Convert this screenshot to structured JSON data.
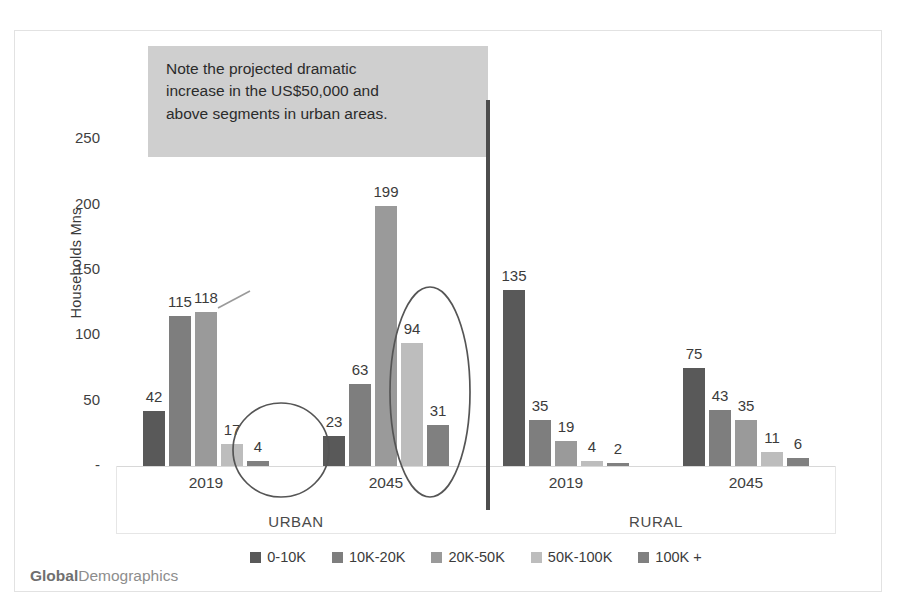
{
  "chart_data": {
    "type": "bar",
    "title": "",
    "xlabel": "",
    "ylabel": "Households Mns",
    "ylim": [
      0,
      280
    ],
    "yticks": [
      "-",
      "50",
      "100",
      "150",
      "200",
      "250"
    ],
    "ytick_values": [
      0,
      50,
      100,
      150,
      200,
      250
    ],
    "grid": false,
    "legend_position": "bottom",
    "categories": [
      "2019",
      "2045",
      "2019",
      "2045"
    ],
    "group_labels": [
      "URBAN",
      "RURAL"
    ],
    "series": [
      {
        "name": "0-10K",
        "color": "#595959",
        "values": [
          42,
          23,
          135,
          75
        ]
      },
      {
        "name": "10K-20K",
        "color": "#7e7e7e",
        "values": [
          115,
          63,
          35,
          43
        ]
      },
      {
        "name": "20K-50K",
        "color": "#9a9a9a",
        "values": [
          118,
          199,
          19,
          35
        ]
      },
      {
        "name": "50K-100K",
        "color": "#bdbdbd",
        "values": [
          17,
          94,
          4,
          11
        ]
      },
      {
        "name": "100K +",
        "color": "#808080",
        "values": [
          4,
          31,
          2,
          6
        ]
      }
    ],
    "annotations": [
      {
        "type": "callout",
        "text": "Note the projected dramatic increase in the US$50,000 and above segments in urban areas."
      },
      {
        "type": "ellipse",
        "target": "urban-2019-high-income"
      },
      {
        "type": "ellipse",
        "target": "urban-2045-high-income"
      },
      {
        "type": "divider",
        "target": "urban-rural-separator"
      }
    ]
  },
  "callout": {
    "line1": "Note the projected dramatic",
    "line2": "increase in the US$50,000 and",
    "line3": "above segments in urban areas.",
    "background": "#cfcfcf"
  },
  "axis": {
    "y_title": "Households Mns",
    "y_ticks": [
      "250",
      "200",
      "150",
      "100",
      "50",
      "-"
    ],
    "x_years": [
      "2019",
      "2045",
      "2019",
      "2045"
    ],
    "x_regions": [
      "URBAN",
      "RURAL"
    ]
  },
  "legend": {
    "items": [
      {
        "label": "0-10K",
        "color": "#595959"
      },
      {
        "label": "10K-20K",
        "color": "#7e7e7e"
      },
      {
        "label": "20K-50K",
        "color": "#9a9a9a"
      },
      {
        "label": "50K-100K",
        "color": "#bdbdbd"
      },
      {
        "label": "100K +",
        "color": "#808080"
      }
    ]
  },
  "watermark": {
    "bold_part": "Global",
    "light_part": "Demographics"
  },
  "bar_labels": {
    "g0": [
      "42",
      "115",
      "118",
      "17",
      "4"
    ],
    "g1": [
      "23",
      "63",
      "199",
      "94",
      "31"
    ],
    "g2": [
      "135",
      "35",
      "19",
      "4",
      "2"
    ],
    "g3": [
      "75",
      "43",
      "35",
      "11",
      "6"
    ]
  }
}
